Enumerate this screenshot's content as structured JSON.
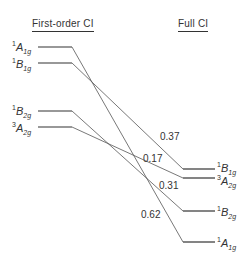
{
  "headers": {
    "left": "First-order CI",
    "right": "Full CI"
  },
  "left_levels": [
    {
      "sup": "1",
      "main": "A",
      "sub": "1g",
      "y": 47
    },
    {
      "sup": "1",
      "main": "B",
      "sub": "1g",
      "y": 63
    },
    {
      "sup": "1",
      "main": "B",
      "sub": "2g",
      "y": 111
    },
    {
      "sup": "3",
      "main": "A",
      "sub": "2g",
      "y": 127
    }
  ],
  "right_levels": [
    {
      "sup": "1",
      "main": "B",
      "sub": "1g",
      "y": 169
    },
    {
      "sup": "3",
      "main": "A",
      "sub": "2g",
      "y": 178
    },
    {
      "sup": "1",
      "main": "B",
      "sub": "2g",
      "y": 211
    },
    {
      "sup": "1",
      "main": "A",
      "sub": "1g",
      "y": 242
    }
  ],
  "connections": [
    {
      "from": "1A1g",
      "to": "1A1g",
      "coefficient": "0.62"
    },
    {
      "from": "1B1g",
      "to": "1B1g",
      "coefficient": "0.37"
    },
    {
      "from": "3A2g",
      "to": "3A2g",
      "coefficient": "0.17"
    },
    {
      "from": "1B2g",
      "to": "1B2g",
      "coefficient": "0.31"
    }
  ]
}
